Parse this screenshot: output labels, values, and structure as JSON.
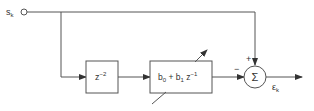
{
  "diagram": {
    "type": "block-diagram",
    "input": {
      "label": "s",
      "subscript": "k"
    },
    "delay_block": {
      "base": "z",
      "exponent": "−2"
    },
    "filter_block": {
      "term0": "b",
      "term0_sub": "0",
      "plus": " + ",
      "term1": "b",
      "term1_sub": "1",
      "z": " z",
      "z_exp": "−1"
    },
    "summer": {
      "symbol": "Σ",
      "plus_sign": "+",
      "minus_sign": "−"
    },
    "output": {
      "label": "ε",
      "subscript": "k"
    },
    "colors": {
      "line": "#555555",
      "text": "#333333",
      "background": "#ffffff"
    }
  }
}
